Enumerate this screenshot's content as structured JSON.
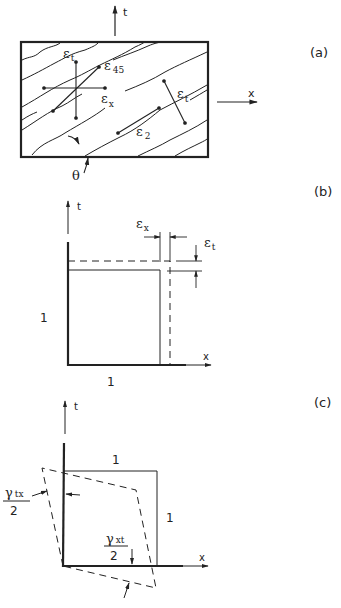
{
  "figure": {
    "panels": [
      {
        "id": "a",
        "label": "(a)",
        "axes": {
          "vertical": "t",
          "horizontal": "x"
        },
        "strain_labels": {
          "eps_t_top": {
            "sym": "ε",
            "sub": "t"
          },
          "eps_45": {
            "sym": "ε",
            "sub": "45"
          },
          "eps_x": {
            "sym": "ε",
            "sub": "x"
          },
          "eps_t_right": {
            "sym": "ε",
            "sub": "t"
          },
          "eps_2": {
            "sym": "ε",
            "sub": "2"
          }
        },
        "angle_label": "θ"
      },
      {
        "id": "b",
        "label": "(b)",
        "axes": {
          "vertical": "t",
          "horizontal": "x"
        },
        "strain_labels": {
          "eps_x": {
            "sym": "ε",
            "sub": "x"
          },
          "eps_t": {
            "sym": "ε",
            "sub": "t"
          }
        },
        "side_label_left": "1",
        "side_label_bottom": "1"
      },
      {
        "id": "c",
        "label": "(c)",
        "axes": {
          "vertical": "t",
          "horizontal": "x"
        },
        "side_label_top": "1",
        "side_label_right": "1",
        "shear_labels": {
          "gamma_tx": {
            "num_sym": "γ",
            "num_sub": "tx",
            "den": "2"
          },
          "gamma_xt": {
            "num_sym": "γ",
            "num_sub": "xt",
            "den": "2"
          }
        }
      }
    ],
    "colors": {
      "ink": "#222222",
      "background": "#ffffff"
    }
  }
}
